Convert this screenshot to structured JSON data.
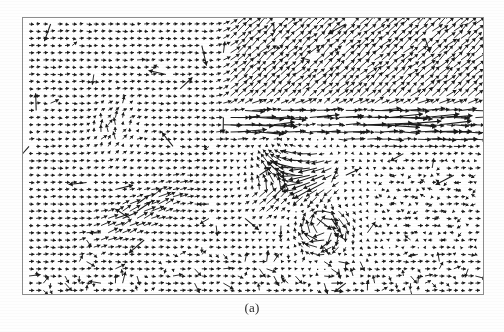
{
  "figure": {
    "caption": "(a)",
    "frame": {
      "x": 22,
      "y": 17,
      "width": 462,
      "height": 278,
      "border_color": "#8d8d8d",
      "background": "#ffffff"
    },
    "ink_color": "#1a1a1a",
    "page_background": "#fefefe"
  },
  "chart_data": {
    "type": "quiver",
    "title": "",
    "subtitle": "",
    "xlabel": "",
    "ylabel": "",
    "xlim": [
      0,
      460
    ],
    "ylim": [
      0,
      276
    ],
    "grid": false,
    "legend": null,
    "annotations": [
      "(a)"
    ],
    "grid_spacing": {
      "dx": 7.2,
      "dy": 7.2
    },
    "grid_origin": {
      "x": 6,
      "y": 6
    },
    "grid_counts": {
      "nx": 63,
      "ny": 38
    },
    "arrow_scale": 1.0,
    "head_length": 2.6,
    "regions": [
      {
        "name": "left-uniform-field",
        "bbox": [
          0,
          0,
          195,
          276
        ],
        "mean_angle_deg": 2,
        "mean_magnitude": 5.0,
        "note": "short uniform rightward vectors"
      },
      {
        "name": "upper-right-diagonal-field",
        "bbox": [
          195,
          0,
          265,
          95
        ],
        "mean_angle_deg": 44,
        "mean_magnitude": 9.5,
        "note": "longer vectors pointing up and to the right"
      },
      {
        "name": "central-horizontal-streak-band",
        "bbox": [
          190,
          88,
          270,
          40
        ],
        "mean_angle_deg": 4,
        "mean_magnitude": 26.0,
        "note": "band of very long rightward vectors"
      },
      {
        "name": "central-swirl",
        "bbox": [
          205,
          125,
          135,
          100
        ],
        "mean_angle_deg": 200,
        "mean_magnitude": 14.0,
        "note": "divergent / rotational high-magnitude structure"
      },
      {
        "name": "lower-left-streak",
        "bbox": [
          55,
          165,
          120,
          60
        ],
        "mean_angle_deg": 32,
        "mean_magnitude": 12.0,
        "note": "diagonal streak of medium vectors"
      },
      {
        "name": "right-lower-field",
        "bbox": [
          340,
          130,
          120,
          146
        ],
        "mean_angle_deg": 178,
        "mean_magnitude": 5.5,
        "note": "short vectors, mixed left/right"
      },
      {
        "name": "bottom-uniform-field",
        "bbox": [
          0,
          225,
          460,
          51
        ],
        "mean_angle_deg": 3,
        "mean_magnitude": 4.5,
        "note": "short uniform rightward vectors"
      }
    ]
  }
}
